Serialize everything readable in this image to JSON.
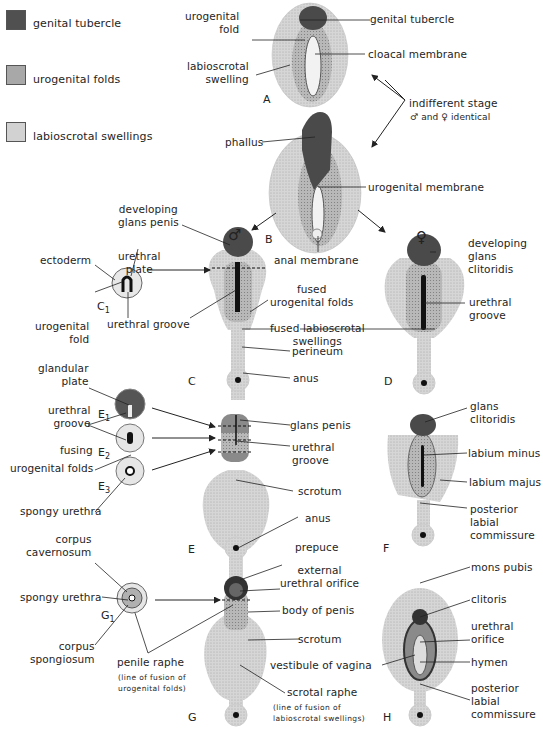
{
  "legend": [
    {
      "label": "genital tubercle",
      "color": "#505050"
    },
    {
      "label": "urogenital folds",
      "color": "#a8a8a8"
    },
    {
      "label": "labioscrotal swellings",
      "color": "#d2d2d2"
    }
  ],
  "colors": {
    "tubercle": "#555555",
    "folds": "#b3b3b3",
    "swellings": "#d4d4d4",
    "line": "#222222"
  },
  "stage_a": {
    "letter": "A",
    "labels": {
      "urogenital_fold": "urogenital\nfold",
      "labioscrotal_swelling": "labioscrotal\nswelling",
      "genital_tubercle": "genital tubercle",
      "cloacal_membrane": "cloacal membrane"
    }
  },
  "indifferent": {
    "line1": "indifferent stage",
    "line2": "♂ and ♀ identical"
  },
  "stage_b": {
    "letter": "B",
    "labels": {
      "phallus": "phallus",
      "urogenital_membrane": "urogenital membrane",
      "anal_membrane": "anal membrane"
    }
  },
  "male_symbol": "♂",
  "female_symbol": "♀",
  "stage_c": {
    "letter": "C",
    "inset_letter": "C",
    "inset_sub": "1",
    "labels": {
      "developing_glans_penis": "developing\nglans penis",
      "ectoderm": "ectoderm",
      "urethral_plate": "urethral\nplate",
      "urogenital_fold": "urogenital\nfold",
      "urethral_groove": "urethral groove",
      "fused_urogenital_folds": "fused\nurogenital folds",
      "fused_labioscrotal_swellings": "fused labioscrotal\nswellings",
      "perineum": "perineum",
      "anus": "anus"
    }
  },
  "stage_d": {
    "letter": "D",
    "labels": {
      "developing_glans_clitoridis": "developing\nglans\nclitoridis",
      "urethral_groove": "urethral\ngroove"
    }
  },
  "stage_e": {
    "letter": "E",
    "insets": [
      {
        "letter": "E",
        "sub": "1"
      },
      {
        "letter": "E",
        "sub": "2"
      },
      {
        "letter": "E",
        "sub": "3"
      }
    ],
    "labels": {
      "glandular_plate": "glandular\nplate",
      "urethral_groove_left": "urethral\ngroove",
      "fusing": "fusing",
      "urogenital_folds": "urogenital folds",
      "spongy_urethra": "spongy urethra",
      "glans_penis": "glans penis",
      "urethral_groove": "urethral\ngroove",
      "scrotum": "scrotum",
      "anus": "anus"
    }
  },
  "stage_f": {
    "letter": "F",
    "labels": {
      "glans_clitoridis": "glans\nclitoridis",
      "labium_minus": "labium minus",
      "labium_majus": "labium majus",
      "posterior_labial_commissure": "posterior\nlabial\ncommissure"
    }
  },
  "stage_g": {
    "letter": "G",
    "inset_letter": "G",
    "inset_sub": "1",
    "labels": {
      "corpus_cavernosum": "corpus\ncavernosum",
      "spongy_urethra": "spongy urethra",
      "corpus_spongiosum": "corpus\nspongiosum",
      "penile_raphe": "penile raphe",
      "penile_raphe_note": "(line of fusion of\nurogenital folds)",
      "prepuce": "prepuce",
      "external_urethral_orifice": "external\nurethral orifice",
      "body_of_penis": "body of penis",
      "scrotum": "scrotum",
      "vestibule_of_vagina": "vestibule of vagina",
      "scrotal_raphe": "scrotal raphe",
      "scrotal_raphe_note": "(line of fusion of\nlabioscrotal swellings)"
    }
  },
  "stage_h": {
    "letter": "H",
    "labels": {
      "mons_pubis": "mons pubis",
      "clitoris": "clitoris",
      "urethral_orifice": "urethral\norifice",
      "hymen": "hymen",
      "posterior_labial_commissure": "posterior\nlabial\ncommissure"
    }
  }
}
